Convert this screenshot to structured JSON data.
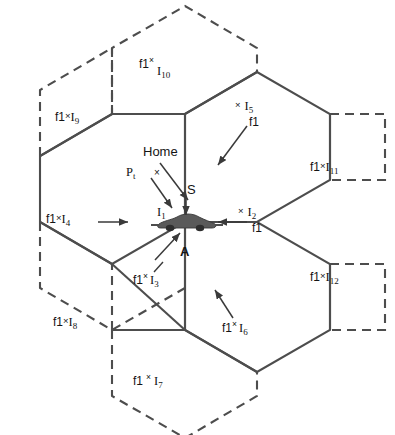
{
  "figure": {
    "type": "hexagonal-cell-cluster-diagram",
    "stroke_color": "#4d4d4d",
    "background": "#ffffff",
    "vehicle_color": "#555555"
  },
  "center": {
    "vehicle_label": "A",
    "home_label": "Home",
    "pt_label": "P",
    "pt_sub": "t",
    "s_label": "S",
    "i1_label": "I",
    "i1_sub": "1",
    "x_mark": "×"
  },
  "cells": [
    {
      "id": "I1",
      "f1": "f1",
      "x": "×",
      "sub": "1",
      "text": "f1 × I₁",
      "style": "raised-x",
      "arrow": "down-right"
    },
    {
      "id": "I2",
      "f1": "f1",
      "x": "×",
      "sub": "2",
      "text": "× I₂ / f1",
      "style": "stacked",
      "arrow": "left"
    },
    {
      "id": "I3",
      "f1": "f1",
      "x": "×",
      "sub": "3",
      "text": "f1 × I₃",
      "style": "raised-x",
      "arrow": "up-right"
    },
    {
      "id": "I4",
      "f1": "f1",
      "x": "×",
      "sub": "4",
      "text": "f1 × I₄",
      "style": "inline",
      "arrow": "right"
    },
    {
      "id": "I5",
      "f1": "f1",
      "x": "×",
      "sub": "5",
      "text": "× I₅ / f1",
      "style": "stacked",
      "arrow": "down-left"
    },
    {
      "id": "I6",
      "f1": "f1",
      "x": "×",
      "sub": "6",
      "text": "f1 × I₆",
      "style": "raised-x",
      "arrow": "up-left"
    },
    {
      "id": "I7",
      "f1": "f1",
      "x": "×",
      "sub": "7",
      "text": "f1 × I₇",
      "style": "raised-x",
      "arrow": "none"
    },
    {
      "id": "I8",
      "f1": "f1",
      "x": "×",
      "sub": "8",
      "text": "f1 × I₈",
      "style": "inline",
      "arrow": "none"
    },
    {
      "id": "I9",
      "f1": "f1",
      "x": "×",
      "sub": "9",
      "text": "f1 × I₉",
      "style": "inline",
      "arrow": "none"
    },
    {
      "id": "I10",
      "f1": "f1",
      "x": "×",
      "sub": "10",
      "text": "f1 × I₁₀",
      "style": "raised-x",
      "arrow": "none"
    },
    {
      "id": "I11",
      "f1": "f1",
      "x": "×",
      "sub": "11",
      "text": "f1 × I₁₁",
      "style": "inline",
      "arrow": "none"
    },
    {
      "id": "I12",
      "f1": "f1",
      "x": "×",
      "sub": "12",
      "text": "f1 × I₁₂",
      "style": "inline",
      "arrow": "none"
    }
  ],
  "labels": {
    "l_i10_f1": "f1",
    "l_i10_x": "×",
    "l_i10_I": "I",
    "l_i10_sub": "10",
    "l_i9_f1": "f1",
    "l_i9_x": "×",
    "l_i9_I": "I",
    "l_i9_sub": "9",
    "l_i5_x": "×",
    "l_i5_I": "I",
    "l_i5_sub": "5",
    "l_i5_f1": "f1",
    "l_i11_f1": "f1",
    "l_i11_x": "×",
    "l_i11_I": "I",
    "l_i11_sub": "11",
    "l_i4_f1": "f1",
    "l_i4_x": "×",
    "l_i4_I": "I",
    "l_i4_sub": "4",
    "l_i2_x": "×",
    "l_i2_I": "I",
    "l_i2_sub": "2",
    "l_i2_f1": "f1",
    "l_i12_f1": "f1",
    "l_i12_x": "×",
    "l_i12_I": "I",
    "l_i12_sub": "12",
    "l_i3_f1": "f1",
    "l_i3_x": "×",
    "l_i3_I": "I",
    "l_i3_sub": "3",
    "l_i8_f1": "f1",
    "l_i8_x": "×",
    "l_i8_I": "I",
    "l_i8_sub": "8",
    "l_i6_f1": "f1",
    "l_i6_x": "×",
    "l_i6_I": "I",
    "l_i6_sub": "6",
    "l_i7_f1": "f1",
    "l_i7_x": "×",
    "l_i7_I": "I",
    "l_i7_sub": "7",
    "l_home": "Home",
    "l_pt": "P",
    "l_pt_sub": "t",
    "l_s": "S",
    "l_i1_I": "I",
    "l_i1_sub": "1",
    "l_a": "A",
    "l_x_home": "×"
  }
}
